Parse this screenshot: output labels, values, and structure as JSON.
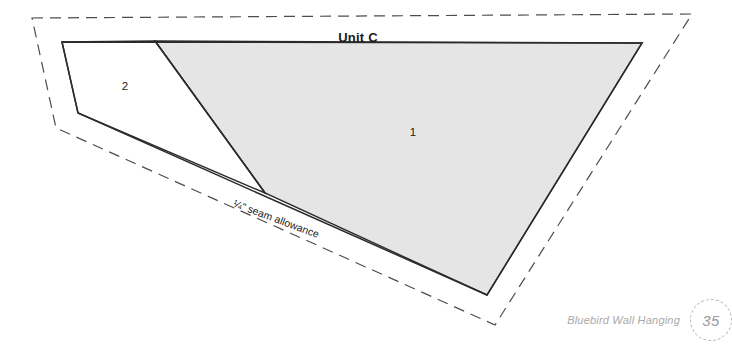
{
  "document": {
    "unit_title": "Unit C",
    "seam_allowance_label": "¼\" seam allowance"
  },
  "pieces": [
    {
      "id": "1",
      "label": "1",
      "fill_color": "#e5e5e5",
      "stroke_color": "#2b2b2b"
    },
    {
      "id": "2",
      "label": "2",
      "fill_color": "#ffffff",
      "stroke_color": "#2b2b2b"
    }
  ],
  "geometry": {
    "cutting_line_color": "#4d4d4d",
    "sewing_line_color": "#2b2b2b",
    "gray_fill": "#e5e5e5",
    "cutting_line_points": "32,18 692,14 495,325 56,128",
    "sewing_outline_points": "62,42 642,43 487,295 78,113",
    "piece1_points": "155,41 642,43 487,295 265,193",
    "piece2_points": "62,42 155,41 265,193 78,113",
    "divider_line": "155,41 265,193"
  },
  "footer": {
    "title": "Bluebird Wall Hanging",
    "page_number": "35",
    "text_color": "#a9a9a9"
  }
}
